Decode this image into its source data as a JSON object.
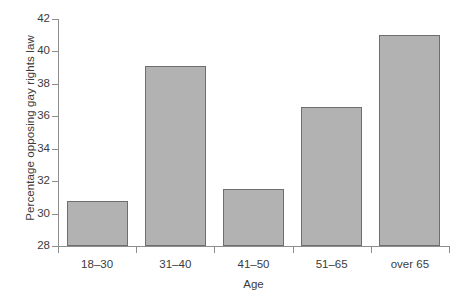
{
  "chart_data": {
    "type": "bar",
    "title": "",
    "xlabel": "Age",
    "ylabel": "Percentage opposing gay rights law",
    "categories": [
      "18–30",
      "31–40",
      "41–50",
      "51–65",
      "over 65"
    ],
    "values": [
      30.8,
      39.1,
      31.5,
      36.6,
      41.0
    ],
    "ylim": [
      28,
      42
    ],
    "yticks": [
      28,
      30,
      32,
      34,
      36,
      38,
      40,
      42
    ],
    "ytick_labels": [
      "28",
      "30",
      "32",
      "34",
      "36",
      "38",
      "40",
      "42"
    ],
    "grid": false,
    "legend": null,
    "bar_color": "#b2b2b2",
    "bar_edge_color": "#6e6e6e",
    "axis_color": "#8d8d8d",
    "text_color": "#3b3b3b",
    "background": "#ffffff"
  },
  "figure": {
    "caption_fragment": ""
  }
}
